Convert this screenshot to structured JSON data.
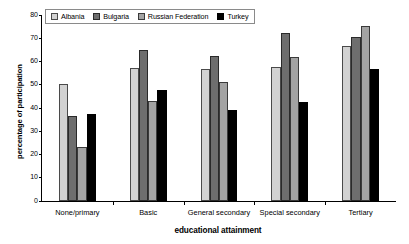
{
  "chart_data": {
    "type": "bar",
    "title": "",
    "xlabel": "educational attainment",
    "ylabel": "percentage of participation",
    "categories": [
      "None/primary",
      "Basic",
      "General secondary",
      "Special secondary",
      "Tertiary"
    ],
    "series": [
      {
        "name": "Albania",
        "color": "#d2d2d2",
        "values": [
          50.3,
          57.4,
          56.7,
          57.8,
          66.8
        ]
      },
      {
        "name": "Bulgaria",
        "color": "#6e6e6e",
        "values": [
          36.5,
          65.0,
          62.4,
          72.3,
          70.5
        ]
      },
      {
        "name": "Russian Federation",
        "color": "#a3a3a3",
        "values": [
          23.3,
          42.9,
          51.4,
          61.8,
          75.4
        ]
      },
      {
        "name": "Turkey",
        "color": "#000000",
        "values": [
          37.4,
          47.9,
          39.0,
          42.6,
          56.6
        ]
      }
    ],
    "ylim": [
      0,
      80
    ],
    "yticks": [
      0,
      10,
      20,
      30,
      40,
      50,
      60,
      70,
      80
    ],
    "ytick_labels": [
      "0",
      "10",
      "20",
      "30",
      "40",
      "50",
      "60",
      "70",
      "80"
    ],
    "grid": false,
    "legend_position": "top-left"
  }
}
